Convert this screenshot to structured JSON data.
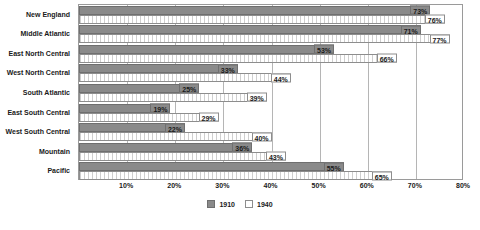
{
  "chart_data": {
    "type": "bar",
    "orientation": "horizontal",
    "title": "",
    "subtitle": "",
    "xlabel": "",
    "ylabel": "",
    "xlim": [
      0,
      80
    ],
    "xticks": [
      10,
      20,
      30,
      40,
      50,
      60,
      70,
      80
    ],
    "xtick_labels": [
      "10%",
      "20%",
      "30%",
      "40%",
      "50%",
      "60%",
      "70%",
      "80%"
    ],
    "grid": true,
    "grid_axis": "x",
    "legend_position": "bottom-center",
    "categories": [
      "New England",
      "Middle Atlantic",
      "East North Central",
      "West North Central",
      "South Atlantic",
      "East South Central",
      "West South Central",
      "Mountain",
      "Pacific"
    ],
    "series": [
      {
        "name": "1910",
        "color": "#8a8a8a",
        "values": [
          73,
          71,
          53,
          33,
          25,
          19,
          22,
          36,
          55
        ],
        "labels": [
          "73%",
          "71%",
          "53%",
          "33%",
          "25%",
          "19%",
          "22%",
          "36%",
          "55%"
        ]
      },
      {
        "name": "1940",
        "color": "#ffffff",
        "values": [
          76,
          77,
          66,
          44,
          39,
          29,
          40,
          43,
          65
        ],
        "labels": [
          "76%",
          "77%",
          "66%",
          "44%",
          "39%",
          "29%",
          "40%",
          "43%",
          "65%"
        ]
      }
    ]
  },
  "legend": {
    "items": [
      {
        "label": "1910"
      },
      {
        "label": "1940"
      }
    ]
  },
  "footnote": {
    "text": ""
  },
  "colors": {
    "series_1910": "#8a8a8a",
    "series_1940": "#ffffff",
    "gridline": "#b5b5b5",
    "border": "#9a9a9a",
    "text": "#1a1a1a"
  }
}
